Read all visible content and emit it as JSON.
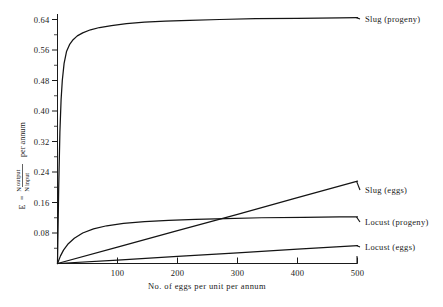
{
  "chart_data": {
    "type": "line",
    "title": "",
    "xlabel": "No. of eggs per unit per annum",
    "ylabel": "E = N output / N input per annum",
    "ylabel_parts": {
      "symbol": "E",
      "equals": "=",
      "numerator_n": "N",
      "numerator_word": "output",
      "denominator_n": "N",
      "denominator_word": "input",
      "suffix": "per annum"
    },
    "xlim": [
      0,
      520
    ],
    "ylim": [
      0,
      0.68
    ],
    "grid": false,
    "legend_position": "right-inline-labels",
    "x_ticks": [
      100,
      200,
      300,
      400,
      500
    ],
    "x_tick_labels": [
      "100",
      "200",
      "300",
      "400",
      "500"
    ],
    "x_minor_step": 20,
    "y_ticks": [
      0.08,
      0.16,
      0.24,
      0.32,
      0.4,
      0.48,
      0.56,
      0.64
    ],
    "y_tick_labels": [
      "0.08",
      "0.16",
      "0.24",
      "0.32",
      "0.40",
      "0.48",
      "0.56",
      "0.64"
    ],
    "y_minor_step": 0.04,
    "series": [
      {
        "name": "Slug (progeny)",
        "label": "Slug (progeny)",
        "shape": "saturating",
        "label_x": 363,
        "label_y": 19,
        "x": [
          0,
          2,
          4,
          6,
          8,
          11,
          15,
          20,
          26,
          33,
          42,
          55,
          70,
          90,
          115,
          145,
          180,
          220,
          270,
          330,
          400,
          470,
          500
        ],
        "y": [
          0.0,
          0.2,
          0.345,
          0.43,
          0.48,
          0.525,
          0.556,
          0.574,
          0.587,
          0.597,
          0.605,
          0.613,
          0.619,
          0.624,
          0.629,
          0.633,
          0.636,
          0.638,
          0.64,
          0.642,
          0.643,
          0.644,
          0.645
        ]
      },
      {
        "name": "Slug (eggs)",
        "label": "Slug (eggs)",
        "shape": "linear",
        "label_x": 363,
        "label_y": 190,
        "x": [
          0,
          100,
          200,
          300,
          400,
          500
        ],
        "y": [
          0.0,
          0.043,
          0.086,
          0.129,
          0.173,
          0.216
        ]
      },
      {
        "name": "Locust (progeny)",
        "label": "Locust (progeny)",
        "shape": "saturating",
        "label_x": 363,
        "label_y": 222,
        "x": [
          0,
          5,
          10,
          18,
          28,
          42,
          60,
          82,
          110,
          145,
          185,
          230,
          280,
          340,
          410,
          470,
          500
        ],
        "y": [
          0.0,
          0.02,
          0.035,
          0.052,
          0.066,
          0.08,
          0.091,
          0.099,
          0.105,
          0.11,
          0.113,
          0.116,
          0.118,
          0.12,
          0.121,
          0.122,
          0.122
        ]
      },
      {
        "name": "Locust (eggs)",
        "label": "Locust (eggs)",
        "shape": "linear",
        "label_x": 363,
        "label_y": 247,
        "x": [
          0,
          100,
          200,
          300,
          400,
          500
        ],
        "y": [
          0.0,
          0.009,
          0.019,
          0.028,
          0.038,
          0.047
        ]
      }
    ]
  }
}
